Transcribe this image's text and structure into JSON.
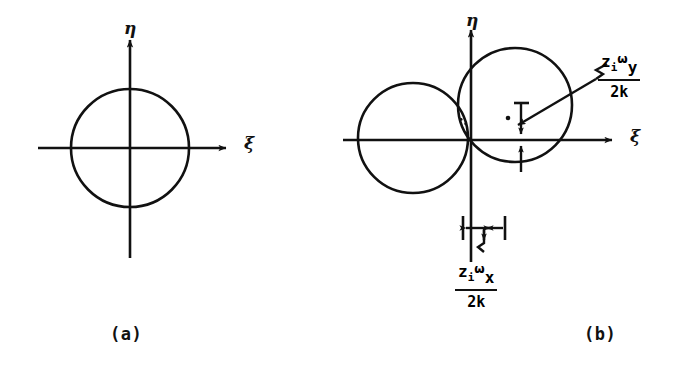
{
  "figure": {
    "kind": "two-panel line diagram",
    "background": "#ffffff",
    "ink": "#111111"
  },
  "panels": [
    {
      "id": "a",
      "caption": "(a)",
      "axes": {
        "eta_label": "η",
        "xi_label": "ξ",
        "origin": [
          130,
          148
        ],
        "x_extent": [
          38,
          232
        ],
        "y_extent": [
          34,
          258
        ]
      },
      "circles": [
        {
          "name": "beam-circle",
          "cx": 130,
          "cy": 148,
          "r": 59,
          "fill": "none"
        }
      ]
    },
    {
      "id": "b",
      "caption": "(b)",
      "axes": {
        "eta_label": "η",
        "xi_label": "ξ",
        "origin": [
          471,
          140
        ],
        "x_extent": [
          343,
          618
        ],
        "y_extent": [
          24,
          262
        ]
      },
      "circles": [
        {
          "name": "left-circle",
          "cx": 413,
          "cy": 138,
          "r": 55,
          "fill": "none"
        },
        {
          "name": "right-circle",
          "cx": 515,
          "cy": 105,
          "r": 57,
          "fill": "none"
        }
      ],
      "overlap_region": {
        "name": "stippled-lens",
        "hatch": "dotted-stipple",
        "dot_count": 26
      },
      "dimensions": [
        {
          "name": "vertical-offset",
          "orientation": "vertical",
          "from": [
            521,
            103
          ],
          "to": [
            521,
            172
          ],
          "label": {
            "numerator": "zᵢωᵧ",
            "denominator": "2k"
          }
        },
        {
          "name": "horizontal-offset",
          "orientation": "horizontal",
          "from": [
            463,
            228
          ],
          "to": [
            505,
            228
          ],
          "label": {
            "numerator": "zᵢωₓ",
            "denominator": "2k"
          }
        }
      ],
      "leader": {
        "name": "radius-leader-arrow",
        "from": [
          598,
          78
        ],
        "to": [
          512,
          128
        ],
        "style": "zigzag-tail-arrow"
      }
    }
  ],
  "labels": {
    "eta": "η",
    "xi": "ξ",
    "panel_a": "(a)",
    "panel_b": "(b)",
    "frac_y": {
      "z": "z",
      "i": "i",
      "omega": "ω",
      "axis": "y",
      "den": "2k"
    },
    "frac_x": {
      "z": "z",
      "i": "i",
      "omega": "ω",
      "axis": "x",
      "den": "2k"
    }
  }
}
